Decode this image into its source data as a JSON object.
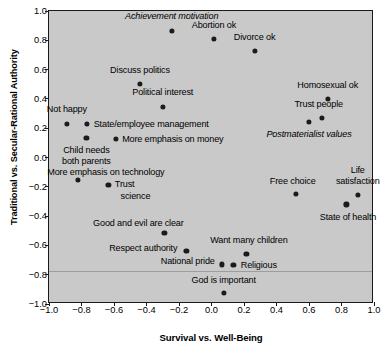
{
  "chart_data": {
    "type": "scatter",
    "title": "",
    "xlabel": "Survival vs. Well-Being",
    "ylabel": "Traditional vs. Secular-Rational Authority",
    "xlim": [
      -1.0,
      1.0
    ],
    "ylim": [
      -1.0,
      1.0
    ],
    "xticks": [
      "-1.0",
      "-0.8",
      "-0.6",
      "-0.4",
      "-0.2",
      "0.0",
      "0.2",
      "0.4",
      "0.6",
      "0.8",
      "1.0"
    ],
    "yticks": [
      "1.0",
      "0.8",
      "0.6",
      "0.4",
      "0.2",
      "0.0",
      "-0.2",
      "-0.4",
      "-0.6",
      "-0.8",
      "-1.0"
    ],
    "grid": false,
    "legend": "none",
    "plot_background": "#c9c9c9",
    "point_color": "#1b1b1b",
    "points": [
      {
        "label": "Achievement motivation",
        "x": -0.245,
        "y": 0.865,
        "italic": true,
        "lx": -0.245,
        "ly": 0.965,
        "align": "center"
      },
      {
        "label": "Abortion ok",
        "x": 0.015,
        "y": 0.81,
        "italic": false,
        "lx": 0.015,
        "ly": 0.905,
        "align": "center"
      },
      {
        "label": "Divorce ok",
        "x": 0.265,
        "y": 0.725,
        "italic": false,
        "lx": 0.265,
        "ly": 0.825,
        "align": "center"
      },
      {
        "label": "Discuss politics",
        "x": -0.44,
        "y": 0.5,
        "italic": false,
        "lx": -0.44,
        "ly": 0.6,
        "align": "center"
      },
      {
        "label": "Political interest",
        "x": -0.3,
        "y": 0.345,
        "italic": false,
        "lx": -0.3,
        "ly": 0.445,
        "align": "center"
      },
      {
        "label": "Homosexual ok",
        "x": 0.715,
        "y": 0.4,
        "italic": false,
        "lx": 0.715,
        "ly": 0.497,
        "align": "center"
      },
      {
        "label": "Trust people",
        "x": 0.68,
        "y": 0.27,
        "italic": false,
        "lx": 0.66,
        "ly": 0.368,
        "align": "center"
      },
      {
        "label": "Not happy",
        "x": -0.89,
        "y": 0.23,
        "italic": false,
        "lx": -0.89,
        "ly": 0.33,
        "align": "center"
      },
      {
        "label": "State/employee management",
        "x": -0.765,
        "y": 0.228,
        "italic": false,
        "lx": -0.725,
        "ly": 0.228,
        "align": "left"
      },
      {
        "label": "Postmaterialist values",
        "x": 0.6,
        "y": 0.245,
        "italic": true,
        "lx": 0.6,
        "ly": 0.163,
        "align": "center"
      },
      {
        "label": "Child needs",
        "x": -0.77,
        "y": 0.135,
        "italic": false,
        "lx": -0.77,
        "ly": 0.05,
        "align": "center"
      },
      {
        "label": "both parents",
        "x": null,
        "y": null,
        "italic": false,
        "lx": -0.77,
        "ly": -0.025,
        "align": "center"
      },
      {
        "label": "More emphasis on money",
        "x": -0.59,
        "y": 0.125,
        "italic": false,
        "lx": -0.55,
        "ly": 0.125,
        "align": "left"
      },
      {
        "label": "More emphasis on technology",
        "x": -0.82,
        "y": -0.155,
        "italic": false,
        "lx": -0.65,
        "ly": -0.1,
        "align": "center"
      },
      {
        "label": "Trust",
        "x": -0.635,
        "y": -0.185,
        "italic": false,
        "lx": -0.595,
        "ly": -0.18,
        "align": "left"
      },
      {
        "label": "science",
        "x": null,
        "y": null,
        "italic": false,
        "lx": -0.56,
        "ly": -0.265,
        "align": "left"
      },
      {
        "label": "Free choice",
        "x": 0.52,
        "y": -0.25,
        "italic": false,
        "lx": 0.5,
        "ly": -0.16,
        "align": "center"
      },
      {
        "label": "Life",
        "x": null,
        "y": null,
        "italic": false,
        "lx": 0.9,
        "ly": -0.083,
        "align": "center"
      },
      {
        "label": "satisfaction",
        "x": 0.9,
        "y": -0.255,
        "italic": false,
        "lx": 0.9,
        "ly": -0.163,
        "align": "center"
      },
      {
        "label": "State of health",
        "x": 0.83,
        "y": -0.32,
        "italic": false,
        "lx": 0.84,
        "ly": -0.405,
        "align": "center"
      },
      {
        "label": "Good and evil are clear",
        "x": -0.29,
        "y": -0.515,
        "italic": false,
        "lx": -0.45,
        "ly": -0.45,
        "align": "center"
      },
      {
        "label": "Respect authority",
        "x": -0.155,
        "y": -0.64,
        "italic": false,
        "lx": -0.21,
        "ly": -0.62,
        "align": "right"
      },
      {
        "label": "Want many children",
        "x": 0.215,
        "y": -0.66,
        "italic": false,
        "lx": 0.23,
        "ly": -0.565,
        "align": "center"
      },
      {
        "label": "National pride",
        "x": 0.065,
        "y": -0.73,
        "italic": false,
        "lx": 0.02,
        "ly": -0.705,
        "align": "right"
      },
      {
        "label": "Religious",
        "x": 0.135,
        "y": -0.735,
        "italic": false,
        "lx": 0.18,
        "ly": -0.735,
        "align": "left"
      },
      {
        "label": "God is important",
        "x": 0.075,
        "y": -0.925,
        "italic": false,
        "lx": 0.075,
        "ly": -0.835,
        "align": "center"
      }
    ]
  }
}
